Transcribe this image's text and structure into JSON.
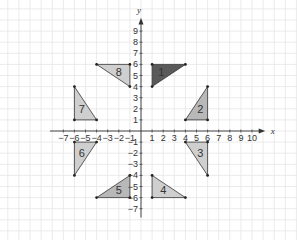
{
  "diagram": {
    "type": "coordinate-grid-transformations",
    "axes": {
      "x_label": "x",
      "y_label": "y",
      "x_ticks": [
        -7,
        -6,
        -5,
        -4,
        -3,
        -2,
        -1,
        1,
        2,
        3,
        4,
        5,
        6,
        7,
        8,
        9,
        10
      ],
      "y_ticks": [
        9,
        8,
        7,
        6,
        5,
        4,
        3,
        2,
        1,
        -1,
        -2,
        -3,
        -4,
        -5,
        -6,
        -7
      ],
      "x_range": [
        -7,
        10
      ],
      "y_range": [
        -7,
        9
      ]
    },
    "colors": {
      "grid": "#e6e6e6",
      "axis": "#333333",
      "shape_fill": "#cfcfcf",
      "shape_fill_mid": "#b8b8b8",
      "shape_fill_dark": "#5a5a5a",
      "shape_stroke": "#333333"
    },
    "triangles": [
      {
        "label": "1",
        "vertices": [
          [
            1,
            6
          ],
          [
            4,
            6
          ],
          [
            1,
            4
          ]
        ],
        "shade": "dark"
      },
      {
        "label": "2",
        "vertices": [
          [
            6,
            4
          ],
          [
            6,
            1
          ],
          [
            4,
            1
          ]
        ],
        "shade": "mid"
      },
      {
        "label": "3",
        "vertices": [
          [
            4,
            -1
          ],
          [
            6,
            -1
          ],
          [
            6,
            -4
          ]
        ],
        "shade": "light"
      },
      {
        "label": "4",
        "vertices": [
          [
            1,
            -4
          ],
          [
            1,
            -6
          ],
          [
            4,
            -6
          ]
        ],
        "shade": "light"
      },
      {
        "label": "5",
        "vertices": [
          [
            -1,
            -4
          ],
          [
            -1,
            -6
          ],
          [
            -4,
            -6
          ]
        ],
        "shade": "mid"
      },
      {
        "label": "6",
        "vertices": [
          [
            -6,
            -1
          ],
          [
            -4,
            -1
          ],
          [
            -6,
            -4
          ]
        ],
        "shade": "light"
      },
      {
        "label": "7",
        "vertices": [
          [
            -6,
            4
          ],
          [
            -6,
            1
          ],
          [
            -4,
            1
          ]
        ],
        "shade": "light"
      },
      {
        "label": "8",
        "vertices": [
          [
            -4,
            6
          ],
          [
            -1,
            6
          ],
          [
            -1,
            4
          ]
        ],
        "shade": "light"
      }
    ]
  }
}
